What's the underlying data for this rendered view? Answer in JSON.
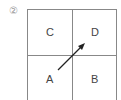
{
  "figure": {
    "number_label": "②",
    "cells": {
      "top_left": "C",
      "top_right": "D",
      "bottom_left": "A",
      "bottom_right": "B"
    },
    "arrow": {
      "from": "A",
      "to": "D"
    }
  }
}
